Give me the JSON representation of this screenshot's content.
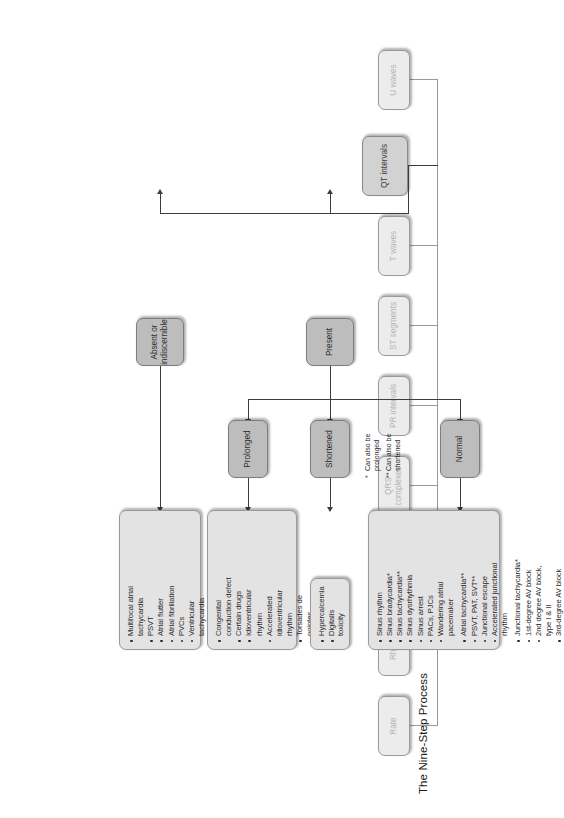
{
  "title": "The Nine-Step Process",
  "steps": [
    {
      "id": "rate",
      "label": "Rate",
      "tone": "light"
    },
    {
      "id": "rhythm",
      "label": "Rhythm",
      "tone": "light"
    },
    {
      "id": "p-waves",
      "label": "P waves",
      "tone": "light"
    },
    {
      "id": "qrs-complexes",
      "label": "QRS complexes",
      "tone": "light"
    },
    {
      "id": "pr-intervals",
      "label": "PR intervals",
      "tone": "light"
    },
    {
      "id": "st-segments",
      "label": "ST segments",
      "tone": "light"
    },
    {
      "id": "t-waves",
      "label": "T waves",
      "tone": "light"
    },
    {
      "id": "qt-intervals",
      "label": "QT intervals",
      "tone": "mid"
    },
    {
      "id": "u-waves",
      "label": "U waves",
      "tone": "light"
    }
  ],
  "branches": {
    "present": "Present",
    "absent": "Absent or indiscernible",
    "normal": "Normal",
    "shortened": "Shortened",
    "prolonged": "Prolonged"
  },
  "lists": {
    "normal": [
      "Sinus rhythm",
      "Sinus bradycardia*",
      "Sinus tachycardia**",
      "Sinus dysrhythmia",
      "Sinus arrest",
      "PACs, PJCs",
      "Wandering atrial",
      "pacemaker",
      "Atrial tachycardia**",
      "PSVT, PAT, SVT**",
      "Junctional escape",
      "Accelerated junctional",
      "rhythm",
      "Junctional tachycardia*",
      "1st-degree AV block",
      "2nd degree AV block,",
      "type I & II",
      "3rd-degree AV block"
    ],
    "shortened": [
      "Hypercalcemia",
      "Digitalis toxicity"
    ],
    "prolonged": [
      "Congenital",
      "conduction defect",
      "Certain drugs",
      "Idioventricular",
      "rhythm",
      "Accelerated",
      "idioventricular",
      "rhythm",
      "Torsades de",
      "pointes",
      "Hypokalemia",
      "Hypocalcemia"
    ],
    "absent": [
      "Multifocal atrial",
      "tachycardia",
      "PSVT",
      "Atrial flutter",
      "Atrial fibrillation",
      "PVCs",
      "Ventricular",
      "tachycardia",
      "Ventricular",
      "fibrillation",
      "Asystole"
    ]
  },
  "footnotes": [
    {
      "mark": "*",
      "text": "Can also be prolonged"
    },
    {
      "mark": "**",
      "text": "Can also be shortened"
    }
  ],
  "colors": {
    "node_light": "#ececec",
    "node_mid": "#d2d2d2",
    "node_dark": "#bdbdbd",
    "panel": "#e3e3e3",
    "line": "#9a9a9a",
    "line_active": "#3d3d3d"
  }
}
